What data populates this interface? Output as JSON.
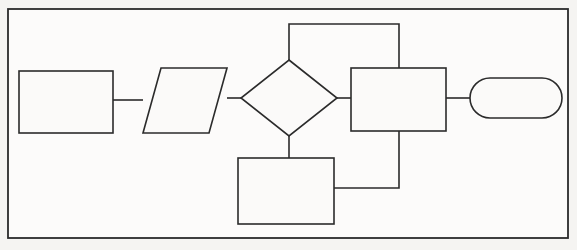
{
  "diagram": {
    "type": "flowchart",
    "canvas": {
      "width": 577,
      "height": 250
    },
    "style": {
      "background_color": "#f5f4f2",
      "shape_fill": "#fbfaf9",
      "stroke_color": "#2b2b2b",
      "stroke_width": 1.6
    },
    "frame": {
      "name": "outer-border",
      "x": 8,
      "y": 9,
      "width": 560,
      "height": 229,
      "label": ""
    },
    "nodes": [
      {
        "id": "process-1",
        "shape": "rectangle",
        "role": "process",
        "label": "",
        "x": 19,
        "y": 71,
        "width": 94,
        "height": 62
      },
      {
        "id": "input-output",
        "shape": "parallelogram",
        "role": "input-output",
        "label": "",
        "x": 143,
        "y": 68,
        "width": 84,
        "height": 65,
        "slant": 18
      },
      {
        "id": "decision",
        "shape": "diamond",
        "role": "decision",
        "label": "",
        "cx": 289,
        "cy": 98,
        "rx": 48,
        "ry": 38
      },
      {
        "id": "process-2",
        "shape": "rectangle",
        "role": "process",
        "label": "",
        "x": 351,
        "y": 68,
        "width": 95,
        "height": 63
      },
      {
        "id": "terminator",
        "shape": "stadium",
        "role": "terminator",
        "label": "",
        "x": 470,
        "y": 78,
        "width": 92,
        "height": 40,
        "corner_radius": 20
      },
      {
        "id": "process-3",
        "shape": "rectangle",
        "role": "process",
        "label": "",
        "x": 238,
        "y": 158,
        "width": 96,
        "height": 66
      }
    ],
    "connectors": [
      {
        "id": "conn-process1-io",
        "from": "process-1",
        "to": "input-output",
        "label": "",
        "points": "113,100 143,100"
      },
      {
        "id": "conn-io-decision",
        "from": "input-output",
        "to": "decision",
        "label": "",
        "points": "227,98 241,98"
      },
      {
        "id": "conn-decision-process2",
        "from": "decision",
        "to": "process-2",
        "label": "",
        "points": "337,98 351,98"
      },
      {
        "id": "conn-decision-top-loop",
        "from": "decision",
        "to": "process-2",
        "label": "",
        "points": "289,60 289,24 399,24 399,68"
      },
      {
        "id": "conn-decision-process3",
        "from": "decision",
        "to": "process-3",
        "label": "",
        "points": "289,136 289,158"
      },
      {
        "id": "conn-process2-bottom-loop",
        "from": "process-2",
        "to": "process-3",
        "label": "",
        "points": "399,131 399,188 334,188"
      },
      {
        "id": "conn-process2-terminator",
        "from": "process-2",
        "to": "terminator",
        "label": "",
        "points": "446,98 470,98"
      }
    ]
  }
}
